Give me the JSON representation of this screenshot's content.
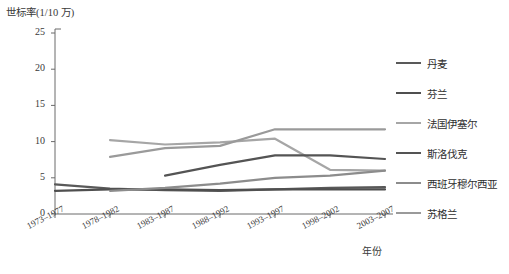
{
  "chart_data": {
    "type": "line",
    "title": "",
    "ylabel": "世标率(1/10 万)",
    "xlabel": "年份",
    "ylim": [
      0,
      25
    ],
    "yticks": [
      0,
      5,
      10,
      15,
      20,
      25
    ],
    "grid": false,
    "legend_position": "right",
    "categories": [
      "1973–1977",
      "1978–1982",
      "1983–1987",
      "1988–1992",
      "1993–1997",
      "1998–2002",
      "2003–2007"
    ],
    "series": [
      {
        "name": "丹麦",
        "color": "#595959",
        "values": [
          4.1,
          3.5,
          3.3,
          3.2,
          3.4,
          3.6,
          3.7
        ]
      },
      {
        "name": "芬兰",
        "color": "#4f4f4f",
        "values": [
          3.2,
          3.4,
          3.4,
          3.3,
          3.4,
          3.4,
          3.4
        ]
      },
      {
        "name": "法国伊塞尔",
        "color": "#a6a6a6",
        "values": [
          null,
          10.2,
          9.6,
          9.9,
          10.4,
          6.1,
          6.0
        ]
      },
      {
        "name": "斯洛伐克",
        "color": "#545454",
        "values": [
          null,
          null,
          5.3,
          6.8,
          8.1,
          8.1,
          7.6
        ]
      },
      {
        "name": "西班牙穆尔西亚",
        "color": "#8c8c8c",
        "values": [
          null,
          3.2,
          3.6,
          4.2,
          5.0,
          5.3,
          6.0
        ]
      },
      {
        "name": "苏格兰",
        "color": "#9a9a9a",
        "values": [
          null,
          7.9,
          9.1,
          9.4,
          11.7,
          11.7,
          11.7
        ]
      }
    ]
  },
  "legend": {
    "items": [
      {
        "label": "丹麦"
      },
      {
        "label": "芬兰"
      },
      {
        "label": "法国伊塞尔"
      },
      {
        "label": "斯洛伐克"
      },
      {
        "label": "西班牙穆尔西亚"
      },
      {
        "label": "苏格兰"
      }
    ]
  }
}
